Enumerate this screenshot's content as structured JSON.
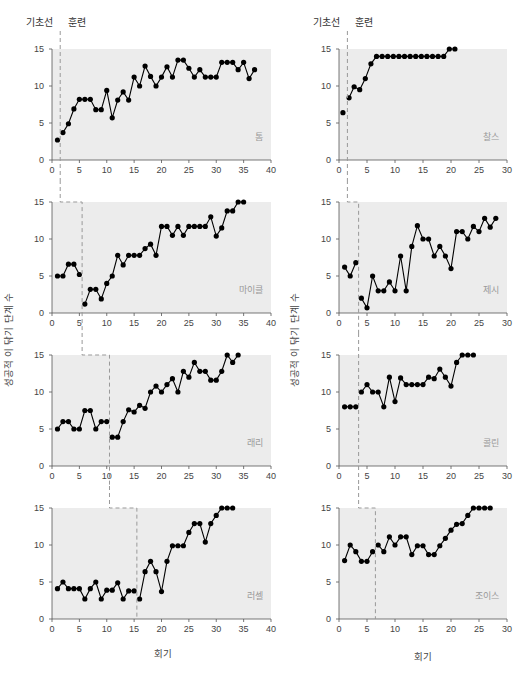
{
  "labels": {
    "baseline": "기초선",
    "training": "훈련",
    "x_axis": "회기",
    "y_axis": "성공적 이 닦기 단계 수"
  },
  "colors": {
    "panel_bg": "#ececec",
    "line": "#000000",
    "marker": "#000000",
    "phase_line": "#999999",
    "axis": "#555555"
  },
  "chart_data": [
    {
      "type": "line",
      "title": "톰",
      "xlabel": "회기",
      "ylabel": "성공적 이 닦기 단계 수",
      "xlim": [
        0,
        40
      ],
      "ylim": [
        0,
        15
      ],
      "xticks": [
        0,
        5,
        10,
        15,
        20,
        25,
        30,
        35,
        40
      ],
      "yticks": [
        0,
        5,
        10,
        15
      ],
      "phase_change_after_session": 1,
      "x": [
        1,
        2,
        3,
        4,
        5,
        6,
        7,
        8,
        9,
        10,
        11,
        12,
        13,
        14,
        15,
        16,
        17,
        18,
        19,
        20,
        21,
        22,
        23,
        24,
        25,
        26,
        27,
        28,
        29,
        30,
        31,
        32,
        33,
        34,
        35,
        36,
        37
      ],
      "values": [
        2.7,
        3.7,
        4.9,
        6.9,
        8.2,
        8.2,
        8.2,
        6.8,
        6.8,
        9.4,
        5.7,
        8.1,
        9.2,
        8.1,
        11.2,
        10,
        12.7,
        11.3,
        10,
        11.2,
        12.6,
        11.2,
        13.5,
        13.5,
        12.4,
        11.2,
        12.2,
        11.2,
        11.2,
        11.2,
        13.2,
        13.2,
        13.2,
        12.2,
        13.2,
        11,
        12.2
      ]
    },
    {
      "type": "line",
      "title": "마이클",
      "xlim": [
        0,
        40
      ],
      "ylim": [
        0,
        15
      ],
      "xticks": [
        0,
        5,
        10,
        15,
        20,
        25,
        30,
        35,
        40
      ],
      "yticks": [
        0,
        5,
        10,
        15
      ],
      "phase_change_after_session": 5,
      "x": [
        1,
        2,
        3,
        4,
        5,
        6,
        7,
        8,
        9,
        10,
        11,
        12,
        13,
        14,
        15,
        16,
        17,
        18,
        19,
        20,
        21,
        22,
        23,
        24,
        25,
        26,
        27,
        28,
        29,
        30,
        31,
        32,
        33,
        34,
        35
      ],
      "values": [
        5,
        5,
        6.6,
        6.6,
        5.2,
        1.2,
        3.2,
        3.2,
        1.9,
        4,
        5,
        7.8,
        6.5,
        7.8,
        7.8,
        7.8,
        8.7,
        9.3,
        7.8,
        11.7,
        11.7,
        10.5,
        11.7,
        10.5,
        11.7,
        11.7,
        11.7,
        11.7,
        13,
        10.4,
        11.5,
        13.8,
        13.8,
        15,
        15
      ]
    },
    {
      "type": "line",
      "title": "래리",
      "xlim": [
        0,
        40
      ],
      "ylim": [
        0,
        15
      ],
      "xticks": [
        0,
        5,
        10,
        15,
        20,
        25,
        30,
        35,
        40
      ],
      "yticks": [
        0,
        5,
        10,
        15
      ],
      "phase_change_after_session": 10,
      "x": [
        1,
        2,
        3,
        4,
        5,
        6,
        7,
        8,
        9,
        10,
        11,
        12,
        13,
        14,
        15,
        16,
        17,
        18,
        19,
        20,
        21,
        22,
        23,
        24,
        25,
        26,
        27,
        28,
        29,
        30,
        31,
        32,
        33,
        34
      ],
      "values": [
        5,
        6,
        6,
        5,
        5,
        7.5,
        7.5,
        5,
        6,
        6,
        3.9,
        3.9,
        6,
        7.6,
        7.3,
        8.2,
        7.8,
        10,
        10.8,
        10,
        11,
        11.8,
        10,
        12.8,
        12,
        14,
        12.8,
        12.8,
        11.6,
        11.6,
        12.8,
        15,
        14,
        15
      ]
    },
    {
      "type": "line",
      "title": "러셀",
      "xlim": [
        0,
        40
      ],
      "ylim": [
        0,
        15
      ],
      "xticks": [
        0,
        5,
        10,
        15,
        20,
        25,
        30,
        35,
        40
      ],
      "yticks": [
        0,
        5,
        10,
        15
      ],
      "phase_change_after_session": 15,
      "x": [
        1,
        2,
        3,
        4,
        5,
        6,
        7,
        8,
        9,
        10,
        11,
        12,
        13,
        14,
        15,
        16,
        17,
        18,
        19,
        20,
        21,
        22,
        23,
        24,
        25,
        26,
        27,
        28,
        29,
        30,
        31,
        32,
        33
      ],
      "values": [
        4.1,
        5,
        4.1,
        4.1,
        4.1,
        2.7,
        4.1,
        5,
        2.7,
        3.9,
        3.9,
        4.9,
        2.7,
        3.8,
        3.8,
        2.7,
        6.4,
        7.8,
        6.4,
        3.7,
        7.8,
        9.9,
        9.9,
        9.9,
        11.7,
        12.9,
        12.9,
        10.4,
        12.9,
        14,
        15,
        15,
        15
      ]
    },
    {
      "type": "line",
      "title": "찰스",
      "xlim": [
        0,
        30
      ],
      "ylim": [
        0,
        15
      ],
      "xticks": [
        0,
        5,
        10,
        15,
        20,
        25,
        30
      ],
      "yticks": [
        0,
        5,
        10,
        15
      ],
      "phase_change_after_session": 1,
      "x": [
        0.7,
        1.8,
        2.7,
        3.7,
        4.7,
        5.7,
        6.7,
        7.7,
        8.7,
        9.7,
        10.7,
        11.7,
        12.7,
        13.7,
        14.7,
        15.7,
        16.7,
        17.7,
        18.7,
        19.7,
        20.7
      ],
      "values": [
        6.4,
        8.4,
        9.9,
        9.5,
        11,
        13,
        14,
        14,
        14,
        14,
        14,
        14,
        14,
        14,
        14,
        14,
        14,
        14,
        14,
        15,
        15
      ]
    },
    {
      "type": "line",
      "title": "제시",
      "xlim": [
        0,
        30
      ],
      "ylim": [
        0,
        15
      ],
      "xticks": [
        0,
        5,
        10,
        15,
        20,
        25,
        30
      ],
      "yticks": [
        0,
        5,
        10,
        15
      ],
      "phase_change_after_session": 3,
      "x": [
        1,
        2,
        3,
        4,
        5,
        6,
        7,
        8,
        9,
        10,
        11,
        12,
        13,
        14,
        15,
        16,
        17,
        18,
        19,
        20,
        21,
        22,
        23,
        24,
        25,
        26,
        27,
        28
      ],
      "values": [
        6.2,
        5,
        6.8,
        2,
        0.7,
        5,
        3,
        3,
        4.2,
        3,
        7.7,
        3,
        9,
        11.8,
        10,
        10,
        7.7,
        9,
        7.7,
        6,
        11,
        11,
        10,
        11.7,
        11,
        12.8,
        11.6,
        12.8
      ]
    },
    {
      "type": "line",
      "title": "콜린",
      "xlim": [
        0,
        30
      ],
      "ylim": [
        0,
        15
      ],
      "xticks": [
        0,
        5,
        10,
        15,
        20,
        25,
        30
      ],
      "yticks": [
        0,
        5,
        10,
        15
      ],
      "phase_change_after_session": 3,
      "x": [
        1,
        2,
        3,
        4,
        5,
        6,
        7,
        8,
        9,
        10,
        11,
        12,
        13,
        14,
        15,
        16,
        17,
        18,
        19,
        20,
        21,
        22,
        23,
        24
      ],
      "values": [
        8,
        8,
        8,
        10,
        11,
        10,
        10,
        8,
        12,
        8.7,
        11.9,
        11,
        11,
        11,
        11,
        12,
        11.8,
        13.1,
        12,
        10.8,
        14,
        15,
        15,
        15
      ]
    },
    {
      "type": "line",
      "title": "조이스",
      "xlim": [
        0,
        30
      ],
      "ylim": [
        0,
        15
      ],
      "xticks": [
        0,
        5,
        10,
        15,
        20,
        25,
        30
      ],
      "yticks": [
        0,
        5,
        10,
        15
      ],
      "phase_change_after_session": 6,
      "x": [
        1,
        2,
        3,
        4,
        5,
        6,
        7,
        8,
        9,
        10,
        11,
        12,
        13,
        14,
        15,
        16,
        17,
        18,
        19,
        20,
        21,
        22,
        23,
        24,
        25,
        26,
        27
      ],
      "values": [
        7.9,
        10,
        9.1,
        7.8,
        7.8,
        9.1,
        10,
        9.1,
        11.1,
        10,
        11.1,
        11.1,
        8.7,
        9.9,
        9.9,
        8.7,
        8.7,
        9.9,
        10.9,
        12,
        12.8,
        12.9,
        14,
        15,
        15,
        15,
        15
      ]
    }
  ]
}
